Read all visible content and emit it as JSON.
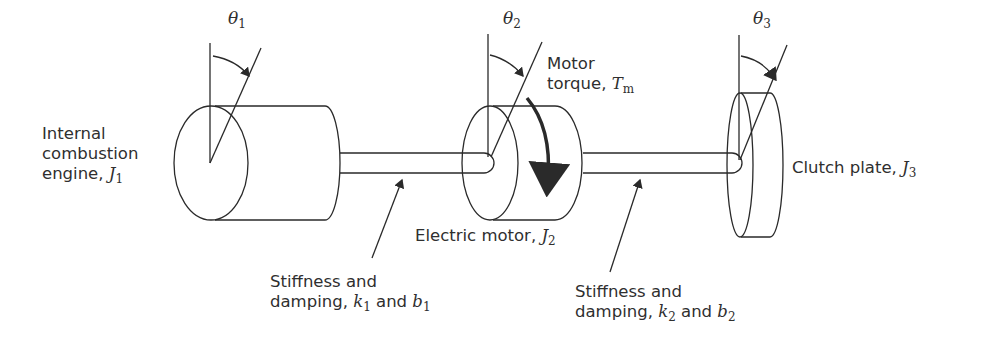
{
  "diagram": {
    "type": "three-inertia torsional drivetrain (hybrid vehicle)",
    "components": [
      {
        "id": "engine",
        "label_lines": [
          "Internal",
          "combustion",
          "engine, "
        ],
        "symbol": "J",
        "subscript": "1",
        "angle_symbol": "θ",
        "angle_subscript": "1"
      },
      {
        "id": "motor",
        "label": "Electric motor, ",
        "symbol": "J",
        "subscript": "2",
        "angle_symbol": "θ",
        "angle_subscript": "2"
      },
      {
        "id": "clutch",
        "label": "Clutch plate, ",
        "symbol": "J",
        "subscript": "3",
        "angle_symbol": "θ",
        "angle_subscript": "3"
      }
    ],
    "torque": {
      "label_lines": [
        "Motor",
        "torque, "
      ],
      "symbol": "T",
      "subscript": "m"
    },
    "shafts": [
      {
        "id": "shaft1",
        "label_lines": [
          "Stiffness and",
          "damping, "
        ],
        "k": "k",
        "k_sub": "1",
        "and": " and ",
        "b": "b",
        "b_sub": "1"
      },
      {
        "id": "shaft2",
        "label_lines": [
          "Stiffness and",
          "damping, "
        ],
        "k": "k",
        "k_sub": "2",
        "and": " and ",
        "b": "b",
        "b_sub": "2"
      }
    ],
    "colors": {
      "line": "#2a2a2a",
      "text": "#2f2f2f",
      "background": "#ffffff"
    }
  }
}
